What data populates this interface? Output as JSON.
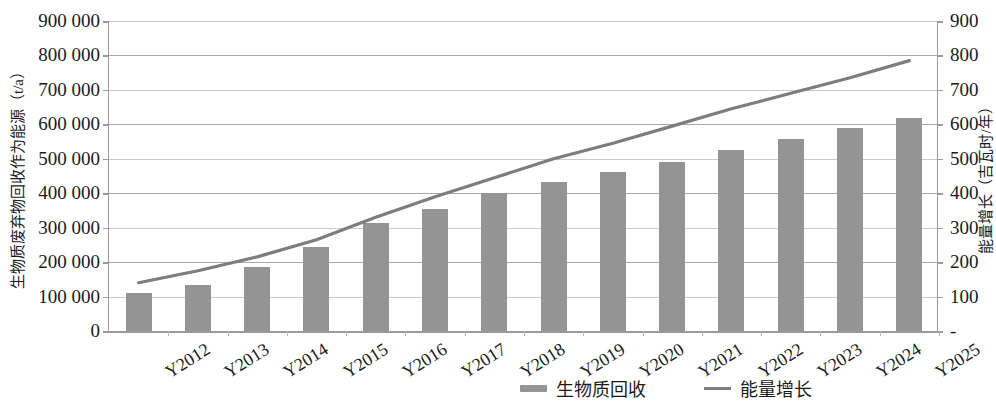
{
  "chart_data": {
    "type": "bar",
    "title": "",
    "categories": [
      "Y2012",
      "Y2013",
      "Y2014",
      "Y2015",
      "Y2016",
      "Y2017",
      "Y2018",
      "Y2019",
      "Y2020",
      "Y2021",
      "Y2022",
      "Y2023",
      "Y2024",
      "Y2025"
    ],
    "series": [
      {
        "name": "生物质回收",
        "type": "bar",
        "axis": "left",
        "unit": "t/a",
        "values": [
          110000,
          135000,
          185000,
          243000,
          313000,
          353000,
          402000,
          432000,
          463000,
          492000,
          525000,
          557000,
          588000,
          618000
        ],
        "color": "#949494"
      },
      {
        "name": "能量增长",
        "type": "line",
        "axis": "right",
        "unit": "吉瓦时/年",
        "values": [
          140,
          175,
          215,
          265,
          330,
          390,
          445,
          500,
          545,
          595,
          645,
          690,
          735,
          785
        ],
        "color": "#7d7d7d"
      }
    ],
    "xlabel": "",
    "ylabel": "生物质废弃物回收作为能源（t/a）",
    "y2label": "能量增长（吉瓦时/年）",
    "ylim": [
      0,
      900000
    ],
    "y2lim": [
      0,
      900
    ],
    "y_ticks": [
      "0",
      "100 000",
      "200 000",
      "300 000",
      "400 000",
      "500 000",
      "600 000",
      "700 000",
      "800 000",
      "900 000"
    ],
    "y2_ticks": [
      "-",
      "100",
      "200",
      "300",
      "400",
      "500",
      "600",
      "700",
      "800",
      "900"
    ],
    "grid": true,
    "legend_position": "bottom-right"
  },
  "axes": {
    "left_title": "生物质废弃物回收作为能源（t/a）",
    "right_title": "能量增长（吉瓦时/年）"
  },
  "legend": {
    "items": [
      {
        "label": "生物质回收",
        "marker": "bar-swatch"
      },
      {
        "label": "能量增长",
        "marker": "line-swatch"
      }
    ]
  }
}
